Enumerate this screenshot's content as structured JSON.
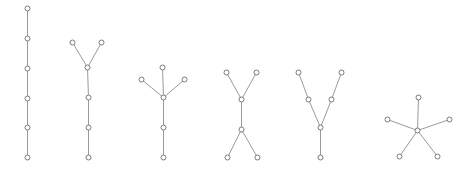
{
  "diagram": {
    "title": "",
    "width": 471,
    "height": 172,
    "style": {
      "edge_color": "#9a9a9a",
      "node_stroke": "#7a7a7a",
      "node_fill": "#ffffff",
      "node_radius": 2.5
    },
    "graphs": [
      {
        "id": "path-6",
        "description": "path graph with 6 vertices",
        "nodes": [
          [
            27,
            8
          ],
          [
            27,
            38
          ],
          [
            27,
            68
          ],
          [
            27,
            98
          ],
          [
            27,
            127
          ],
          [
            27,
            157
          ]
        ],
        "edges": [
          [
            0,
            1
          ],
          [
            1,
            2
          ],
          [
            2,
            3
          ],
          [
            3,
            4
          ],
          [
            4,
            5
          ]
        ]
      },
      {
        "id": "fork-6",
        "description": "path of 4 with two leaves at top",
        "nodes": [
          [
            72,
            42
          ],
          [
            101,
            42
          ],
          [
            87,
            67
          ],
          [
            88,
            97
          ],
          [
            88,
            127
          ],
          [
            88,
            157
          ]
        ],
        "edges": [
          [
            0,
            2
          ],
          [
            1,
            2
          ],
          [
            2,
            3
          ],
          [
            3,
            4
          ],
          [
            4,
            5
          ]
        ]
      },
      {
        "id": "tripod-6",
        "description": "vertex of degree 4 with tail of 2",
        "nodes": [
          [
            141,
            79
          ],
          [
            162,
            67
          ],
          [
            184,
            79
          ],
          [
            163,
            97
          ],
          [
            163,
            127
          ],
          [
            163,
            157
          ]
        ],
        "edges": [
          [
            0,
            3
          ],
          [
            1,
            3
          ],
          [
            2,
            3
          ],
          [
            3,
            4
          ],
          [
            4,
            5
          ]
        ]
      },
      {
        "id": "h-shape-6",
        "description": "two degree-3 vertices joined (H / double fork)",
        "nodes": [
          [
            226,
            72
          ],
          [
            256,
            72
          ],
          [
            241,
            99
          ],
          [
            241,
            129
          ],
          [
            227,
            157
          ],
          [
            257,
            157
          ]
        ],
        "edges": [
          [
            0,
            2
          ],
          [
            1,
            2
          ],
          [
            2,
            3
          ],
          [
            3,
            4
          ],
          [
            3,
            5
          ]
        ]
      },
      {
        "id": "spider-6",
        "description": "degree-3 vertex with two legs of length 2 and one of length 1",
        "nodes": [
          [
            298,
            72
          ],
          [
            341,
            72
          ],
          [
            308,
            99
          ],
          [
            331,
            99
          ],
          [
            320,
            127
          ],
          [
            320,
            157
          ]
        ],
        "edges": [
          [
            0,
            2
          ],
          [
            2,
            4
          ],
          [
            1,
            3
          ],
          [
            3,
            4
          ],
          [
            4,
            5
          ]
        ]
      },
      {
        "id": "star-6",
        "description": "star K1,5",
        "nodes": [
          [
            417,
            130
          ],
          [
            418,
            97
          ],
          [
            387,
            119
          ],
          [
            449,
            119
          ],
          [
            399,
            156
          ],
          [
            437,
            156
          ]
        ],
        "edges": [
          [
            0,
            1
          ],
          [
            0,
            2
          ],
          [
            0,
            3
          ],
          [
            0,
            4
          ],
          [
            0,
            5
          ]
        ]
      }
    ]
  }
}
